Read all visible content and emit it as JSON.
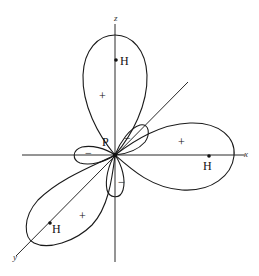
{
  "diagram": {
    "title": "",
    "axes": {
      "z_label": "z",
      "x_label": "x",
      "y_label": "y"
    },
    "center_atom": {
      "label": "P"
    },
    "atoms": [
      {
        "label": "H",
        "position": "on z-axis (top lobe)"
      },
      {
        "label": "H",
        "position": "on x-axis (right lobe)"
      },
      {
        "label": "H",
        "position": "on y-axis (lower-left lobe)"
      }
    ],
    "lobes": {
      "major": [
        {
          "axis": "z",
          "sign": "+"
        },
        {
          "axis": "x",
          "sign": "+"
        },
        {
          "axis": "y",
          "sign": "+"
        }
      ],
      "minor": [
        {
          "axis": "-x",
          "sign": "−"
        },
        {
          "axis": "-z",
          "sign": "−"
        },
        {
          "axis": "-y",
          "sign": "−"
        }
      ]
    },
    "colors": {
      "line": "#1a1a1a",
      "background": "#ffffff"
    }
  }
}
